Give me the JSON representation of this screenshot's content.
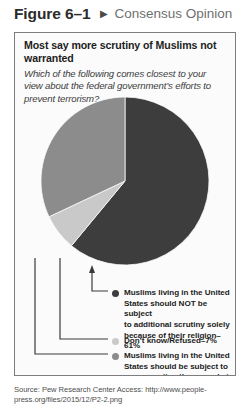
{
  "header": {
    "figure_number": "Figure 6–1",
    "arrow_icon": "play-triangle-right-icon",
    "caption": "Consensus Opinion"
  },
  "panel": {
    "title": "Most say more scrutiny of Muslims not warranted",
    "subtitle": "Which of the following comes closest to your view about the federal government’s efforts to prevent terrorism?"
  },
  "chart_data": {
    "type": "pie",
    "title": "Most say more scrutiny of Muslims not warranted",
    "subtitle": "Which of the following comes closest to your view about the federal government’s efforts to prevent terrorism?",
    "categories": [
      "Muslims living in the United States should NOT be subject to additional scrutiny solely because of their religion",
      "Don’t know/Refused",
      "Muslims living in the United States should be subject to more scrutiny than people in other religious groups"
    ],
    "values": [
      61,
      7,
      32
    ],
    "value_labels": [
      "61%",
      "7%",
      "32%"
    ],
    "colors": [
      "#3d3d3d",
      "#c9c9c9",
      "#8c8c8c"
    ],
    "start_angle_deg": 0,
    "direction": "clockwise",
    "legend_position": "bottom",
    "grid": false
  },
  "legend": [
    {
      "marker_color": "#3d3d3d",
      "label": "Muslims living in the United\nStates should NOT be subject\nto additional scrutiny solely\nbecause of their religion–61%"
    },
    {
      "marker_color": "#c9c9c9",
      "label": "Don’t know/Refused–7%"
    },
    {
      "marker_color": "#8c8c8c",
      "label": "Muslims living in the United\nStates should be subject to\nmore scrutiny than people in\nother religious groups–32%"
    }
  ],
  "source": {
    "text": "Source: Pew Research Center Access: http://www.people-press.org/files/2015/12/P2-2.png"
  }
}
